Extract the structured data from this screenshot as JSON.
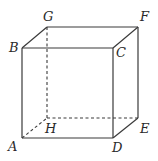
{
  "diagram": {
    "type": "cube",
    "vertices": {
      "A": {
        "label": "A",
        "x": 22,
        "y": 138
      },
      "B": {
        "label": "B",
        "x": 22,
        "y": 48
      },
      "C": {
        "label": "C",
        "x": 113,
        "y": 48
      },
      "D": {
        "label": "D",
        "x": 113,
        "y": 138
      },
      "E": {
        "label": "E",
        "x": 138,
        "y": 118
      },
      "F": {
        "label": "F",
        "x": 138,
        "y": 27
      },
      "G": {
        "label": "G",
        "x": 47,
        "y": 27
      },
      "H": {
        "label": "H",
        "x": 47,
        "y": 118
      }
    },
    "visible_edges": [
      "AB",
      "BC",
      "CD",
      "DA",
      "BG",
      "GF",
      "FC",
      "FE",
      "ED"
    ],
    "hidden_edges": [
      "GH",
      "HE",
      "AH"
    ],
    "colors": {
      "line": "#3a3a3a",
      "label": "#2a2a2a",
      "background": "#ffffff"
    }
  }
}
